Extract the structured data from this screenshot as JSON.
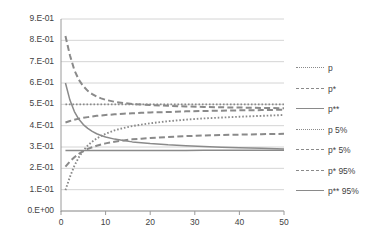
{
  "chart_data": {
    "type": "line",
    "title": "",
    "xlabel": "",
    "ylabel": "",
    "xlim": [
      0,
      50
    ],
    "ylim": [
      0,
      0.9
    ],
    "grid": true,
    "legend_position": "right",
    "x_ticks": [
      "0",
      "10",
      "20",
      "30",
      "40",
      "50"
    ],
    "x_tick_values": [
      0,
      10,
      20,
      30,
      40,
      50
    ],
    "y_ticks": [
      "0.E+00",
      "1.E-01",
      "2.E-01",
      "3.E-01",
      "4.E-01",
      "5.E-01",
      "6.E-01",
      "7.E-01",
      "8.E-01",
      "9.E-01"
    ],
    "y_tick_values": [
      0.0,
      0.1,
      0.2,
      0.3,
      0.4,
      0.5,
      0.6,
      0.7,
      0.8,
      0.9
    ],
    "line_color": "#8a8a8a",
    "grid_color": "#c9c9c9",
    "axis_color": "#9a9a9a",
    "x": [
      1,
      2,
      3,
      4,
      5,
      6,
      7,
      8,
      9,
      10,
      12,
      14,
      16,
      18,
      20,
      24,
      28,
      32,
      36,
      40,
      45,
      50
    ],
    "series": [
      {
        "name": "p",
        "style": "dotted",
        "values": [
          0.5,
          0.5,
          0.5,
          0.5,
          0.5,
          0.5,
          0.5,
          0.5,
          0.5,
          0.5,
          0.5,
          0.5,
          0.5,
          0.5,
          0.5,
          0.5,
          0.5,
          0.5,
          0.5,
          0.5,
          0.5,
          0.5
        ]
      },
      {
        "name": "p*",
        "style": "dashed",
        "values": [
          0.82,
          0.73,
          0.66,
          0.615,
          0.585,
          0.563,
          0.548,
          0.536,
          0.528,
          0.521,
          0.512,
          0.506,
          0.502,
          0.499,
          0.497,
          0.493,
          0.49,
          0.488,
          0.486,
          0.485,
          0.483,
          0.482
        ]
      },
      {
        "name": "p**",
        "style": "solid",
        "values": [
          0.6,
          0.52,
          0.466,
          0.43,
          0.405,
          0.387,
          0.373,
          0.362,
          0.354,
          0.347,
          0.337,
          0.33,
          0.324,
          0.32,
          0.316,
          0.31,
          0.306,
          0.302,
          0.299,
          0.297,
          0.294,
          0.291
        ]
      },
      {
        "name": "p 5%",
        "style": "dotted",
        "values": [
          0.098,
          0.16,
          0.212,
          0.252,
          0.283,
          0.307,
          0.325,
          0.34,
          0.352,
          0.362,
          0.378,
          0.389,
          0.398,
          0.405,
          0.411,
          0.421,
          0.428,
          0.434,
          0.438,
          0.442,
          0.446,
          0.45
        ]
      },
      {
        "name": "p* 5%",
        "style": "dashed",
        "values": [
          0.208,
          0.232,
          0.252,
          0.268,
          0.281,
          0.291,
          0.299,
          0.306,
          0.312,
          0.317,
          0.325,
          0.331,
          0.336,
          0.339,
          0.342,
          0.347,
          0.351,
          0.354,
          0.356,
          0.358,
          0.36,
          0.362
        ]
      },
      {
        "name": "p* 95%",
        "style": "dashed",
        "values": [
          0.415,
          0.422,
          0.428,
          0.433,
          0.437,
          0.44,
          0.443,
          0.446,
          0.448,
          0.45,
          0.453,
          0.456,
          0.458,
          0.46,
          0.462,
          0.464,
          0.467,
          0.469,
          0.47,
          0.472,
          0.473,
          0.475
        ]
      },
      {
        "name": "p** 95%",
        "style": "solid",
        "values": [
          0.284,
          0.284,
          0.284,
          0.284,
          0.284,
          0.284,
          0.284,
          0.284,
          0.284,
          0.284,
          0.284,
          0.284,
          0.284,
          0.284,
          0.284,
          0.284,
          0.284,
          0.285,
          0.285,
          0.285,
          0.285,
          0.285
        ]
      }
    ]
  },
  "legend": {
    "items": [
      {
        "label": "p",
        "style": "dotted"
      },
      {
        "label": "p*",
        "style": "dashed"
      },
      {
        "label": "p**",
        "style": "solid"
      },
      {
        "label": "p 5%",
        "style": "dotted"
      },
      {
        "label": "p* 5%",
        "style": "dashed"
      },
      {
        "label": "p* 95%",
        "style": "dashed"
      },
      {
        "label": "p** 95%",
        "style": "solid"
      }
    ]
  }
}
